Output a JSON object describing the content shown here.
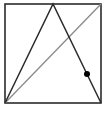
{
  "figure": {
    "width": 105,
    "height": 114,
    "background": "#ffffff",
    "square": {
      "x": 5,
      "y": 4,
      "w": 96,
      "h": 99,
      "stroke": "#2b2b2b",
      "stroke_width": 1.6
    },
    "triangle": {
      "points": [
        [
          5,
          103
        ],
        [
          53,
          4
        ],
        [
          101,
          103
        ]
      ],
      "stroke": "#2b2b2b",
      "stroke_width": 1.5
    },
    "diagonal": {
      "x1": 5,
      "y1": 103,
      "x2": 101,
      "y2": 4,
      "stroke": "#8a8a8a",
      "stroke_width": 1.3
    },
    "point": {
      "cx": 87,
      "cy": 74,
      "r": 3,
      "fill": "#000000"
    }
  }
}
